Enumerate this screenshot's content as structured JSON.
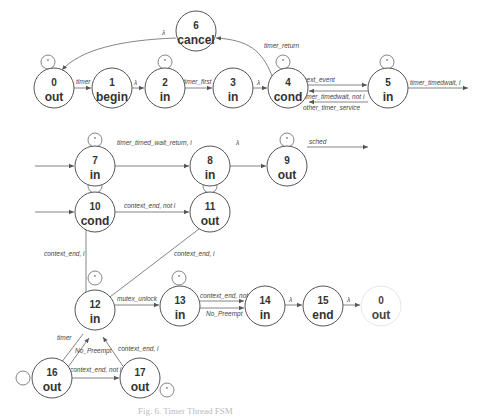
{
  "diagram": {
    "type": "finite-state-machine",
    "caption": "Fig. 6. Timer Thread FSM",
    "colors": {
      "stroke": "#555555",
      "text": "#333333",
      "faint_caption": "#bbbbbb"
    },
    "nodes": [
      {
        "id": "0",
        "label": "out",
        "x": 54,
        "y": 88,
        "r": 20,
        "self_loop": true
      },
      {
        "id": "1",
        "label": "begin",
        "x": 112,
        "y": 88,
        "r": 20,
        "self_loop": false
      },
      {
        "id": "2",
        "label": "in",
        "x": 165,
        "y": 88,
        "r": 20,
        "self_loop": true
      },
      {
        "id": "3",
        "label": "in",
        "x": 233,
        "y": 88,
        "r": 20,
        "self_loop": false
      },
      {
        "id": "4",
        "label": "cond",
        "x": 288,
        "y": 88,
        "r": 20,
        "self_loop": true
      },
      {
        "id": "5",
        "label": "in",
        "x": 388,
        "y": 88,
        "r": 20,
        "self_loop": true
      },
      {
        "id": "6",
        "label": "cancel",
        "x": 196,
        "y": 31,
        "r": 20,
        "self_loop": false
      },
      {
        "id": "7",
        "label": "in",
        "x": 95,
        "y": 166,
        "r": 20,
        "self_loop": true
      },
      {
        "id": "8",
        "label": "in",
        "x": 210,
        "y": 166,
        "r": 20,
        "self_loop": false
      },
      {
        "id": "9",
        "label": "out",
        "x": 287,
        "y": 166,
        "r": 20,
        "self_loop": true
      },
      {
        "id": "10",
        "label": "cond",
        "x": 95,
        "y": 230,
        "r": 20,
        "self_loop": true
      },
      {
        "id": "11",
        "label": "out",
        "x": 210,
        "y": 230,
        "r": 20,
        "self_loop": true
      },
      {
        "id": "12",
        "label": "in",
        "x": 95,
        "y": 320,
        "r": 20,
        "self_loop": true
      },
      {
        "id": "13",
        "label": "in",
        "x": 180,
        "y": 320,
        "r": 20,
        "self_loop": true
      },
      {
        "id": "14",
        "label": "in",
        "x": 265,
        "y": 320,
        "r": 20,
        "self_loop": false
      },
      {
        "id": "15",
        "label": "end",
        "x": 323,
        "y": 320,
        "r": 20,
        "self_loop": false
      },
      {
        "id": "0",
        "label": "out",
        "x": 385,
        "y": 320,
        "r": 20,
        "self_loop": false,
        "faint": true
      },
      {
        "id": "16",
        "label": "out",
        "x": 52,
        "y": 388,
        "r": 20,
        "self_loop": true
      },
      {
        "id": "17",
        "label": "out",
        "x": 140,
        "y": 388,
        "r": 20,
        "self_loop": true
      }
    ],
    "edges": [
      {
        "from": "0",
        "to": "1",
        "label": "timer"
      },
      {
        "from": "1",
        "to": "2",
        "label": "λ"
      },
      {
        "from": "2",
        "to": "3",
        "label": "timer_first"
      },
      {
        "from": "3",
        "to": "4",
        "label": "λ"
      },
      {
        "from": "4",
        "to": "6",
        "label": "timer_return"
      },
      {
        "from": "6",
        "to": "0",
        "label": "λ"
      },
      {
        "from": "4",
        "to": "5",
        "label": "next_event"
      },
      {
        "from": "5",
        "to": "4",
        "label": "timer_timedwait, not i"
      },
      {
        "from": "5",
        "to": "4",
        "label": "other_timer_service"
      },
      {
        "from": "5",
        "to": "exit",
        "label": "timer_timedwait, i"
      },
      {
        "from": "entry",
        "to": "7",
        "label": ""
      },
      {
        "from": "7",
        "to": "8",
        "label": "timer_timed_wait_return, i"
      },
      {
        "from": "8",
        "to": "9",
        "label": "λ"
      },
      {
        "from": "9",
        "to": "exit",
        "label": "sched"
      },
      {
        "from": "entry",
        "to": "10",
        "label": ""
      },
      {
        "from": "10",
        "to": "11",
        "label": "context_end, not i"
      },
      {
        "from": "10",
        "to": "12",
        "label": "context_end, i"
      },
      {
        "from": "11",
        "to": "12",
        "label": "context_end, i"
      },
      {
        "from": "12",
        "to": "13",
        "label": "mutex_unlock"
      },
      {
        "from": "13",
        "to": "14",
        "label": "context_end, not i"
      },
      {
        "from": "13",
        "to": "14",
        "label": "No_Preempt"
      },
      {
        "from": "14",
        "to": "15",
        "label": "λ"
      },
      {
        "from": "15",
        "to": "0",
        "label": "λ"
      },
      {
        "from": "12",
        "to": "16",
        "label": "timer"
      },
      {
        "from": "16",
        "to": "12",
        "label": "No_Preempt"
      },
      {
        "from": "16",
        "to": "17",
        "label": "context_end, not i"
      },
      {
        "from": "17",
        "to": "12",
        "label": "context_end, i"
      }
    ],
    "self_loop_symbol": "*"
  }
}
